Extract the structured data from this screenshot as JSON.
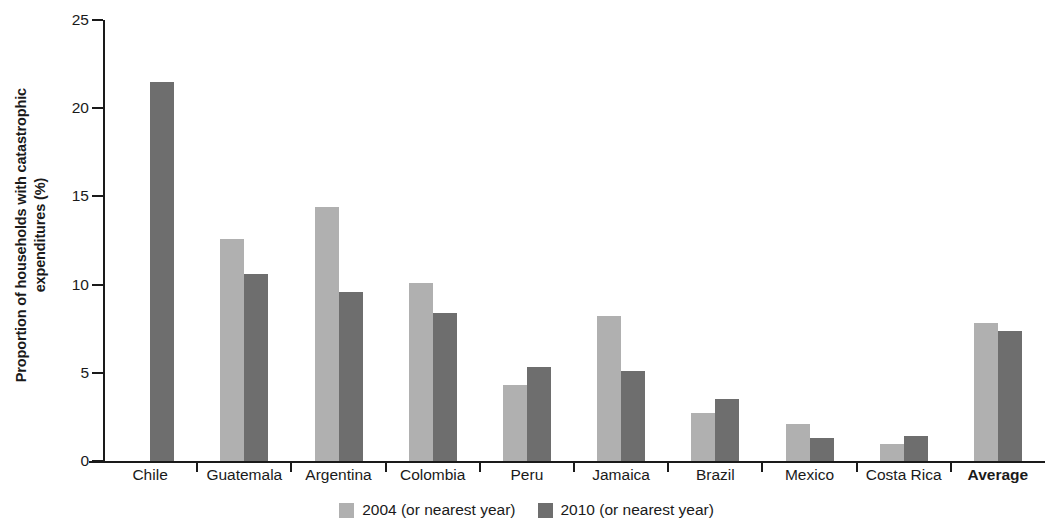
{
  "chart_data": {
    "type": "bar",
    "title": "",
    "xlabel": "",
    "ylabel": "Proportion of households with catastrophic expenditures (%)",
    "ylabel_line1": "Proportion of households with catastrophic",
    "ylabel_line2": "expenditures (%)",
    "ylim": [
      0,
      25
    ],
    "yticks": [
      0,
      5,
      10,
      15,
      20,
      25
    ],
    "ytick_labels": [
      "0",
      "5",
      "10",
      "15",
      "20",
      "25"
    ],
    "grid": false,
    "legend_position": "bottom-center",
    "categories": [
      "Chile",
      "Guatemala",
      "Argentina",
      "Colombia",
      "Peru",
      "Jamaica",
      "Brazil",
      "Mexico",
      "Costa Rica",
      "Average"
    ],
    "series": [
      {
        "name": "2004 (or nearest year)",
        "color": "#b0b0b0",
        "values": [
          null,
          12.6,
          14.4,
          10.1,
          4.3,
          8.2,
          2.7,
          2.1,
          0.95,
          7.8
        ]
      },
      {
        "name": "2010 (or nearest year)",
        "color": "#6e6e6e",
        "values": [
          21.5,
          10.6,
          9.6,
          8.4,
          5.35,
          5.1,
          3.5,
          1.3,
          1.4,
          7.35
        ]
      }
    ],
    "emphasized_category": "Average"
  }
}
